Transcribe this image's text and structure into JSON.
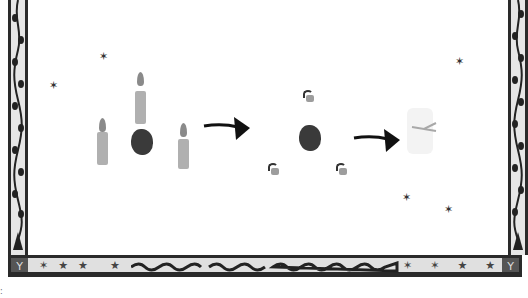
{
  "illustration": {
    "title": "Candle spell transformation sequence",
    "stages": [
      {
        "name": "three-lit-candles-and-stone",
        "candles": 3,
        "stone": true
      },
      {
        "name": "stone-with-three-extinguished-stubs",
        "stubs": 3,
        "stone": true
      },
      {
        "name": "faint-ghost-remnant",
        "faded": true
      }
    ],
    "arrows": 2,
    "decorative_stars": 6,
    "border": {
      "style": "vine-pattern",
      "bottom_band_stars_left": 4,
      "bottom_band_stars_right": 4,
      "corner_glyph": "Y"
    },
    "caption_mark": ":"
  },
  "colors": {
    "border_dark": "#2a2a2a",
    "border_fill": "#e6e6e6",
    "candle": "#b0b0b0",
    "flame": "#8a8a8a",
    "stone": "#3a3a3a",
    "stub": "#9d9d9d",
    "ghost": "#f3f3f3"
  }
}
